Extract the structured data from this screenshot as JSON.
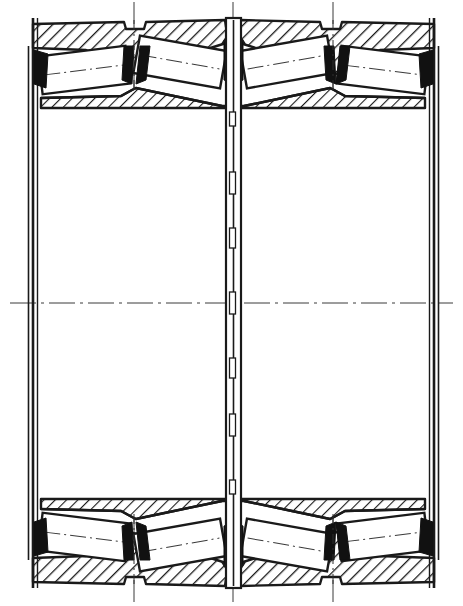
{
  "drawing": {
    "title": "Four-row tapered roller bearing cross-section",
    "type": "technical-line-drawing",
    "background_color": "#ffffff",
    "line_color": "#1a1a1a",
    "hatch_color": "#1a1a1a",
    "fill_solid_color": "#111111",
    "canvas": {
      "width": 463,
      "height": 606
    }
  },
  "geometry": {
    "outer_left_x": 33,
    "outer_right_x": 434,
    "top_y": 18,
    "bottom_y": 588,
    "center_x": 233,
    "center_y": 303,
    "bore_top_y": 108,
    "bore_bottom_y": 499,
    "outer_ring_top_band": [
      18,
      108
    ],
    "outer_ring_bottom_band": [
      499,
      588
    ]
  },
  "components": [
    {
      "name": "outer-ring-upper",
      "role": "cup",
      "hatched": true
    },
    {
      "name": "outer-ring-lower",
      "role": "cup",
      "hatched": true
    },
    {
      "name": "inner-ring-upper",
      "role": "cone",
      "hatched": true
    },
    {
      "name": "inner-ring-lower",
      "role": "cone",
      "hatched": true
    },
    {
      "name": "center-spacer",
      "role": "spacer-ring",
      "hatched": false
    },
    {
      "name": "left-seal-flange",
      "role": "flange",
      "hatched": false
    },
    {
      "name": "right-seal-flange",
      "role": "flange",
      "hatched": false
    }
  ],
  "rollers": {
    "count": 8,
    "rows": 4,
    "description": "tapered rollers, two mirrored rows per half",
    "upper": [
      {
        "id": "roller-ul-1",
        "cx": 84,
        "cy": 70,
        "angle": -7
      },
      {
        "id": "roller-ul-2",
        "cx": 180,
        "cy": 62,
        "angle": 10
      },
      {
        "id": "roller-ur-1",
        "cx": 287,
        "cy": 62,
        "angle": -10
      },
      {
        "id": "roller-ur-2",
        "cx": 383,
        "cy": 70,
        "angle": 7
      }
    ],
    "lower": [
      {
        "id": "roller-ll-1",
        "cx": 84,
        "cy": 537,
        "angle": 7
      },
      {
        "id": "roller-ll-2",
        "cx": 180,
        "cy": 545,
        "angle": -10
      },
      {
        "id": "roller-lr-1",
        "cx": 287,
        "cy": 545,
        "angle": 10
      },
      {
        "id": "roller-lr-2",
        "cx": 383,
        "cy": 537,
        "angle": -7
      }
    ]
  },
  "cages": {
    "count": 8,
    "description": "solid black wedge-shaped cage / rib segments between roller rows"
  },
  "centerlines": {
    "horizontal_axis_y": 303,
    "vertical_axes_x": [
      134,
      233,
      333
    ],
    "style": "dash-dot",
    "roller_axis_style": "dash-dot"
  },
  "labels": {
    "figure_caption": "",
    "dimensions": []
  }
}
